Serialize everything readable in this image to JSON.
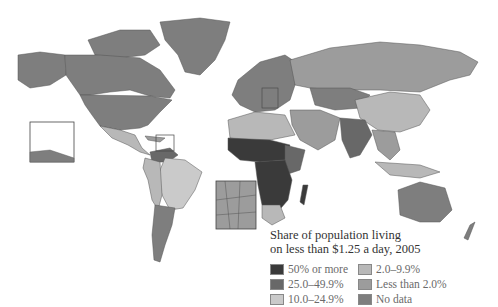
{
  "map": {
    "title": "World map: share of population living on less than $1.25 a day, 2005",
    "insets": [
      "Caribbean inset",
      "Balkans inset"
    ]
  },
  "legend": {
    "title_line1": "Share of population living",
    "title_line2": "on less than $1.25 a day, 2005",
    "items": [
      {
        "label": "50% or more",
        "color": "#3a3a3a"
      },
      {
        "label": "25.0–49.9%",
        "color": "#686868"
      },
      {
        "label": "10.0–24.9%",
        "color": "#cacaca"
      },
      {
        "label": "2.0–9.9%",
        "color": "#b8b8b8"
      },
      {
        "label": "Less than 2.0%",
        "color": "#9c9c9c"
      },
      {
        "label": "No data",
        "color": "#7e7e7e"
      }
    ]
  }
}
